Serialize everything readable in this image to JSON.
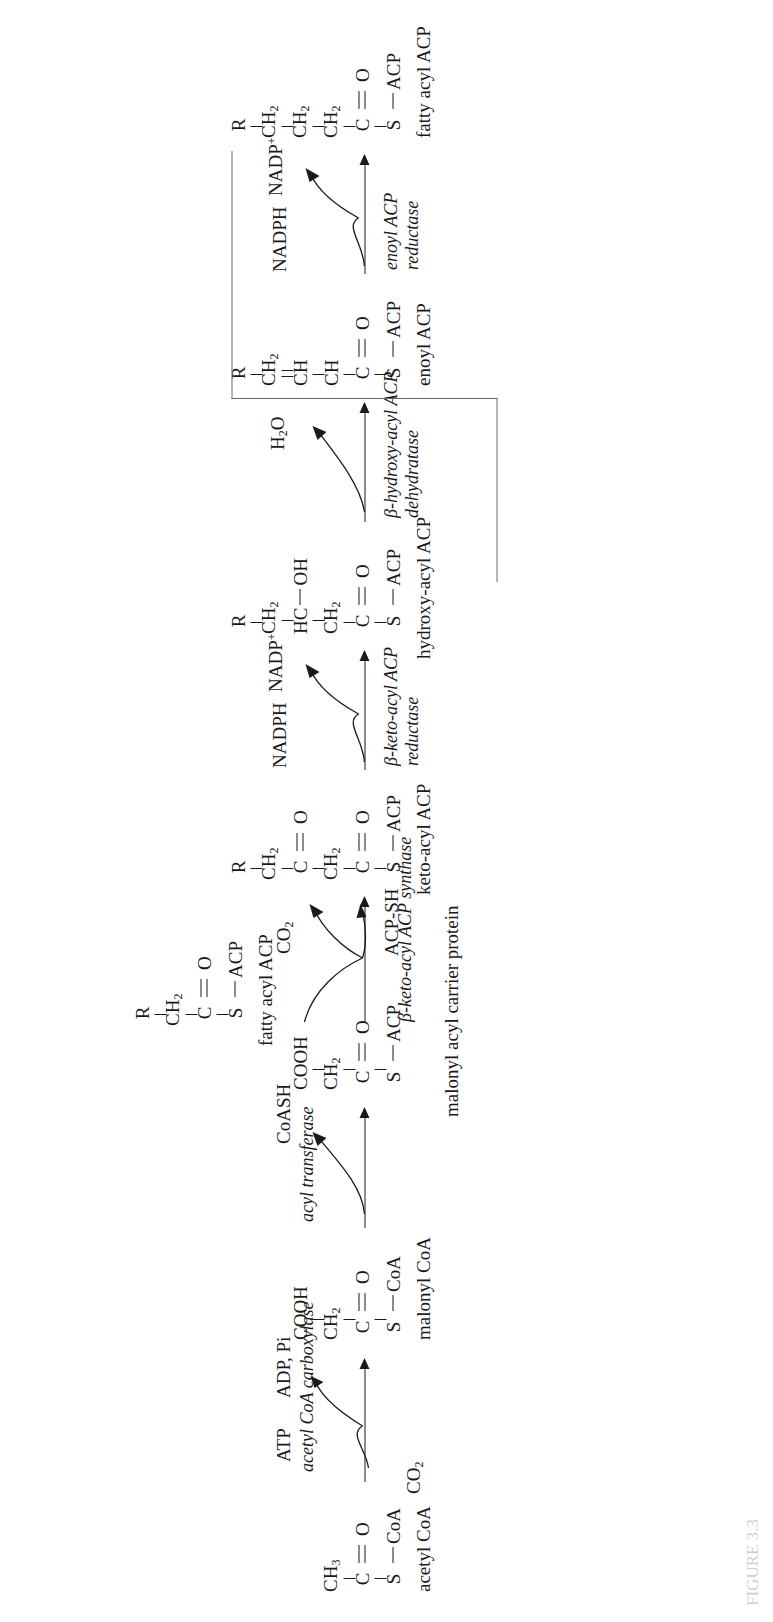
{
  "figure": {
    "caption": "FIGURE 3.3"
  },
  "molecules": [
    {
      "id": "acetyl-coa",
      "label": "acetyl CoA",
      "rows": [
        "CH3",
        "C=O",
        "S — CoA"
      ],
      "atoms": [
        {
          "text": "CH",
          "sub": "3"
        },
        {
          "text": "C",
          "double_to_o": true,
          "o": "O"
        },
        {
          "text": "S",
          "bond": "—",
          "right": "CoA"
        }
      ]
    },
    {
      "id": "malonyl-coa",
      "label": "malonyl CoA",
      "rows": [
        "COOH",
        "CH2",
        "C=O",
        "S — CoA"
      ],
      "atoms": [
        {
          "text": "COOH"
        },
        {
          "text": "CH",
          "sub": "2"
        },
        {
          "text": "C",
          "double_to_o": true,
          "o": "O"
        },
        {
          "text": "S",
          "bond": "—",
          "right": "CoA"
        }
      ]
    },
    {
      "id": "malonyl-acp",
      "label": "malonyl acyl carrier protein",
      "rows": [
        "COOH",
        "CH2",
        "C=O",
        "S — ACP"
      ],
      "atoms": [
        {
          "text": "COOH"
        },
        {
          "text": "CH",
          "sub": "2"
        },
        {
          "text": "C",
          "double_to_o": true,
          "o": "O"
        },
        {
          "text": "S",
          "bond": "—",
          "right": "ACP"
        }
      ]
    },
    {
      "id": "fatty-acyl-acp-in",
      "label": "fatty acyl ACP",
      "rows": [
        "R",
        "CH2",
        "C=O",
        "S — ACP"
      ],
      "atoms": [
        {
          "text": "R"
        },
        {
          "text": "CH",
          "sub": "2"
        },
        {
          "text": "C",
          "double_to_o": true,
          "o": "O"
        },
        {
          "text": "S",
          "bond": "—",
          "right": "ACP"
        }
      ]
    },
    {
      "id": "keto-acyl-acp",
      "label": "keto-acyl ACP",
      "rows": [
        "R",
        "CH2",
        "C=O",
        "CH2",
        "C=O",
        "S — ACP"
      ],
      "atoms": [
        {
          "text": "R"
        },
        {
          "text": "CH",
          "sub": "2"
        },
        {
          "text": "C",
          "double_to_o": true,
          "o": "O"
        },
        {
          "text": "CH",
          "sub": "2"
        },
        {
          "text": "C",
          "double_to_o": true,
          "o": "O"
        },
        {
          "text": "S",
          "bond": "—",
          "right": "ACP"
        }
      ]
    },
    {
      "id": "hydroxy-acyl-acp",
      "label": "hydroxy-acyl ACP",
      "rows": [
        "R",
        "CH2",
        "HC — OH",
        "CH2",
        "C=O",
        "S — ACP"
      ],
      "atoms": [
        {
          "text": "R"
        },
        {
          "text": "CH",
          "sub": "2"
        },
        {
          "text": "HC",
          "bond": "—",
          "right": "OH"
        },
        {
          "text": "CH",
          "sub": "2"
        },
        {
          "text": "C",
          "double_to_o": true,
          "o": "O"
        },
        {
          "text": "S",
          "bond": "—",
          "right": "ACP"
        }
      ]
    },
    {
      "id": "enoyl-acp",
      "label": "enoyl ACP",
      "rows": [
        "R",
        "CH2",
        "CH",
        "CH",
        "C=O",
        "S — ACP"
      ],
      "atoms": [
        {
          "text": "R"
        },
        {
          "text": "CH",
          "sub": "2"
        },
        {
          "text": "CH"
        },
        {
          "text": "CH"
        },
        {
          "text": "C",
          "double_to_o": true,
          "o": "O"
        },
        {
          "text": "S",
          "bond": "—",
          "right": "ACP"
        }
      ]
    },
    {
      "id": "fatty-acyl-acp-out",
      "label": "fatty acyl ACP",
      "rows": [
        "R",
        "CH2",
        "CH2",
        "CH2",
        "C=O",
        "S — ACP"
      ],
      "atoms": [
        {
          "text": "R"
        },
        {
          "text": "CH",
          "sub": "2"
        },
        {
          "text": "CH",
          "sub": "2"
        },
        {
          "text": "CH",
          "sub": "2"
        },
        {
          "text": "C",
          "double_to_o": true,
          "o": "O"
        },
        {
          "text": "S",
          "bond": "—",
          "right": "ACP"
        }
      ]
    }
  ],
  "steps": [
    {
      "id": "carboxylation",
      "enzyme": "acetyl CoA carboxylase",
      "substrate_in": [
        "CO2",
        "ATP"
      ],
      "product_out": [
        "ADP, Pi"
      ]
    },
    {
      "id": "transacylation",
      "enzyme": "acyl transferase",
      "substrate_in": [],
      "product_out": [
        "CoASH"
      ]
    },
    {
      "id": "condensation",
      "enzyme": "β-keto-acyl ACP synthase",
      "substrate_in": [],
      "product_out": [
        "CO2",
        "ACP-SH"
      ]
    },
    {
      "id": "reduction-1",
      "enzyme_line1": "β-keto-acyl ACP",
      "enzyme_line2": "reductase",
      "substrate_in": [
        "NADPH"
      ],
      "product_out": [
        "NADP+"
      ]
    },
    {
      "id": "dehydration",
      "enzyme_line1": "β-hydroxy-acyl ACP",
      "enzyme_line2": "dehydratase",
      "substrate_in": [],
      "product_out": [
        "H2O"
      ]
    },
    {
      "id": "reduction-2",
      "enzyme_line1": "enoyl ACP",
      "enzyme_line2": "reductase",
      "substrate_in": [
        "NADPH"
      ],
      "product_out": [
        "NADP+"
      ]
    }
  ],
  "labels": {
    "acetyl_coa": "acetyl CoA",
    "malonyl_coa": "malonyl CoA",
    "malonyl_acp": "malonyl acyl carrier protein",
    "fatty_acyl_acp_in": "fatty acyl ACP",
    "keto_acyl_acp": "keto-acyl ACP",
    "hydroxy_acyl_acp": "hydroxy-acyl ACP",
    "enoyl_acp": "enoyl ACP",
    "fatty_acyl_acp_out": "fatty acyl ACP"
  },
  "enzymes": {
    "carboxylase": "acetyl CoA carboxylase",
    "transferase": "acyl transferase",
    "synthase": "β-keto-acyl ACP synthase",
    "keto_reductase_l1": "β-keto-acyl ACP",
    "keto_reductase_l2": "reductase",
    "dehydratase_l1": "β-hydroxy-acyl ACP",
    "dehydratase_l2": "dehydratase",
    "enoyl_reductase_l1": "enoyl ACP",
    "enoyl_reductase_l2": "reductase"
  },
  "cofactors": {
    "co2_in": "CO",
    "co2_in_sub": "2",
    "atp": "ATP",
    "adp_pi": "ADP, Pi",
    "coash": "CoASH",
    "co2_out": "CO",
    "co2_out_sub": "2",
    "acp_sh": "ACP-SH",
    "nadph_1": "NADPH",
    "nadp_plus_1": "NADP",
    "nadp_plus_1_sup": "+",
    "h2o": "H",
    "h2o_sub": "2",
    "h2o_tail": "O",
    "nadph_2": "NADPH",
    "nadp_plus_2": "NADP",
    "nadp_plus_2_sup": "+"
  },
  "atoms": {
    "R": "R",
    "C": "C",
    "O": "O",
    "S": "S",
    "CH": "CH",
    "HC": "HC",
    "OH": "OH",
    "COOH": "COOH",
    "CoA": "CoA",
    "ACP": "ACP",
    "sub2": "2",
    "sub3": "3"
  },
  "colors": {
    "ink": "#1a1a1a",
    "loop": "#6a6a6a",
    "background": "#ffffff"
  }
}
